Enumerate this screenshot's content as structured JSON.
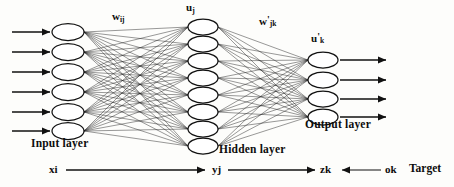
{
  "figure": {
    "type": "neural-network-architecture-diagram",
    "background_color": "#fdfdfb",
    "ink_color": "#111111"
  },
  "layers": [
    {
      "id": "input",
      "label": "Input layer",
      "node_count": 6,
      "activation_symbol": "x",
      "activation_subscript": "i",
      "center_x": 68,
      "node_centers_y": [
        32,
        52,
        72,
        92,
        112,
        131
      ],
      "node_rx": 16,
      "node_ry": 8.5,
      "has_incoming_arrows": true,
      "has_outgoing_arrows": false
    },
    {
      "id": "hidden",
      "label": "Hidden layer",
      "node_count": 8,
      "activation_symbol": "y",
      "activation_subscript": "j",
      "net_input_symbol": "u",
      "net_input_subscript": "j",
      "center_x": 203,
      "node_centers_y": [
        27,
        44,
        61,
        78,
        95,
        112,
        129,
        146
      ],
      "node_rx": 15,
      "node_ry": 8,
      "has_incoming_arrows": false,
      "has_outgoing_arrows": false
    },
    {
      "id": "output",
      "label": "Output layer",
      "node_count": 4,
      "activation_symbol": "z",
      "activation_subscript": "k",
      "net_input_symbol": "u'",
      "net_input_subscript": "k",
      "center_x": 323,
      "node_centers_y": [
        60,
        80,
        99,
        117
      ],
      "node_rx": 15,
      "node_ry": 8,
      "has_incoming_arrows": false,
      "has_outgoing_arrows": true
    }
  ],
  "weight_labels": {
    "input_to_hidden": {
      "symbol": "w",
      "subscript": "ij",
      "prime": false,
      "text": "w",
      "sub_text": "ij"
    },
    "hidden_to_output": {
      "symbol": "w",
      "subscript": "jk",
      "prime": true,
      "text": "w",
      "prime_text": "'",
      "sub_text": "jk"
    }
  },
  "net_input_labels": {
    "hidden": {
      "text": "u",
      "sub_text": "j",
      "prime_text": ""
    },
    "output": {
      "text": "u",
      "prime_text": "'",
      "sub_text": "k"
    }
  },
  "layer_names": {
    "input": "Input layer",
    "hidden": "Hidden layer",
    "output": "Output layer"
  },
  "flow_axis": {
    "x_label": {
      "text": "x",
      "sub_text": "i"
    },
    "y_label": {
      "text": "y",
      "sub_text": "j"
    },
    "z_label": {
      "text": "z",
      "sub_text": "k"
    },
    "o_label": {
      "text": "o",
      "sub_text": "k"
    },
    "target_label": "Target",
    "baseline_y": 170,
    "forward_arrows": [
      {
        "from_x": 66,
        "to_x": 205,
        "direction": "right"
      },
      {
        "from_x": 228,
        "to_x": 315,
        "direction": "right"
      }
    ],
    "backward_arrows": [
      {
        "from_x": 381,
        "to_x": 342,
        "direction": "left"
      }
    ]
  },
  "io_arrows": {
    "input_arrow_start_x": 12,
    "input_arrow_end_x": 50,
    "output_arrow_start_x": 340,
    "output_arrow_end_x": 386,
    "arrow_head_length": 8,
    "arrow_head_half_width": 4
  },
  "connections": {
    "input_to_hidden_fully_connected": true,
    "hidden_to_output_fully_connected": true,
    "input_to_hidden_edge_count": 48,
    "hidden_to_output_edge_count": 32
  }
}
